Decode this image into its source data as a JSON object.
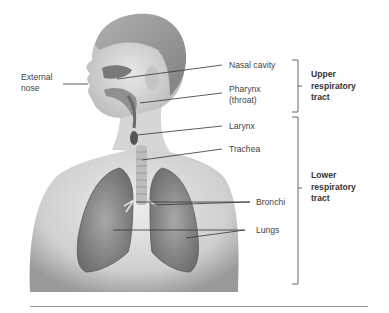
{
  "figure": {
    "labels": {
      "external_nose": [
        "External",
        "nose"
      ],
      "nasal_cavity": "Nasal cavity",
      "pharynx": [
        "Pharynx",
        "(throat)"
      ],
      "larynx": "Larynx",
      "trachea": "Trachea",
      "bronchi": "Bronchi",
      "lungs": "Lungs"
    },
    "groups": {
      "upper": [
        "Upper",
        "respiratory",
        "tract"
      ],
      "lower": [
        "Lower",
        "respiratory",
        "tract"
      ]
    },
    "colors": {
      "skin_light": "#e6e6e6",
      "skin_mid": "#c8c8c8",
      "skin_dark": "#8c8c8c",
      "hair": "#9a9a9a",
      "lung": "#8a8a8a",
      "leader_line": "#333333",
      "bracket": "#555555"
    }
  }
}
